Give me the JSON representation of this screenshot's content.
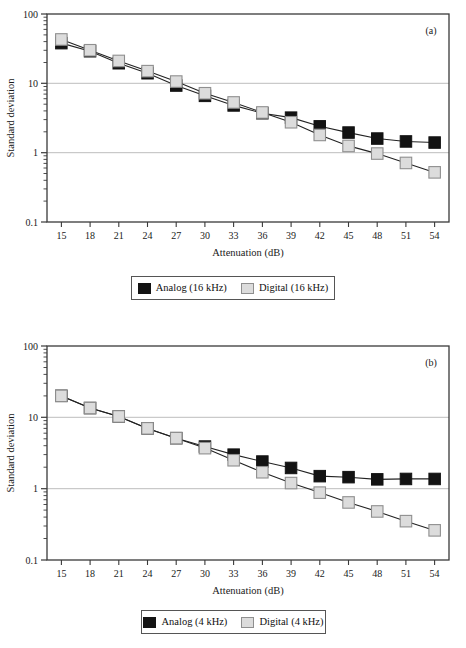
{
  "figure": {
    "panels": [
      {
        "key": "a",
        "label": "(a)",
        "legend": {
          "analog_label": "Analog (16 kHz)",
          "digital_label": "Digital (16 kHz)"
        }
      },
      {
        "key": "b",
        "label": "(b)",
        "legend": {
          "analog_label": "Analog (4 kHz)",
          "digital_label": "Digital (4 kHz)"
        }
      }
    ],
    "colors": {
      "analog": "#131313",
      "digital": "#dcdcdc",
      "digital_border": "#8f8f8f",
      "axis": "#3a3a3a",
      "gridline": "#bdbdbd",
      "line": "#222222"
    }
  },
  "chart_data": [
    {
      "type": "line",
      "panel": "a",
      "title": "",
      "xlabel": "Attenuation (dB)",
      "ylabel": "Standard deviation",
      "yscale": "log",
      "ylim": [
        0.1,
        100
      ],
      "ytick_labels": [
        "100",
        "10",
        "1",
        "0.1"
      ],
      "ytick_values": [
        100,
        10,
        1,
        0.1
      ],
      "grid": true,
      "grid_axis": "y",
      "legend_position": "below",
      "annotation": "(a)",
      "categories": [
        15,
        18,
        21,
        24,
        27,
        30,
        33,
        36,
        39,
        42,
        45,
        48,
        51,
        54
      ],
      "xtick_labels": [
        "15",
        "18",
        "21",
        "24",
        "27",
        "30",
        "33",
        "36",
        "39",
        "42",
        "45",
        "48",
        "51",
        "54"
      ],
      "series": [
        {
          "name": "Analog (16 kHz)",
          "marker": "square",
          "color": "#131313",
          "values": [
            38,
            29,
            19.5,
            14,
            9.3,
            6.6,
            4.8,
            3.7,
            3.2,
            2.4,
            1.95,
            1.6,
            1.45,
            1.4
          ]
        },
        {
          "name": "Digital (16 kHz)",
          "marker": "square",
          "color": "#dcdcdc",
          "values": [
            43,
            30,
            21,
            15,
            10.6,
            7.2,
            5.3,
            3.8,
            2.75,
            1.8,
            1.25,
            0.97,
            0.71,
            0.52
          ]
        }
      ]
    },
    {
      "type": "line",
      "panel": "b",
      "title": "",
      "xlabel": "Attenuation (dB)",
      "ylabel": "Standard deviation",
      "yscale": "log",
      "ylim": [
        0.1,
        100
      ],
      "ytick_labels": [
        "100",
        "10",
        "1",
        "0.1"
      ],
      "ytick_values": [
        100,
        10,
        1,
        0.1
      ],
      "grid": true,
      "grid_axis": "y",
      "legend_position": "below",
      "annotation": "(b)",
      "categories": [
        15,
        18,
        21,
        24,
        27,
        30,
        33,
        36,
        39,
        42,
        45,
        48,
        51,
        54
      ],
      "xtick_labels": [
        "15",
        "18",
        "21",
        "24",
        "27",
        "30",
        "33",
        "36",
        "39",
        "42",
        "45",
        "48",
        "51",
        "54"
      ],
      "series": [
        {
          "name": "Analog (4 kHz)",
          "marker": "square",
          "color": "#131313",
          "values": [
            20,
            13.5,
            10.3,
            7.0,
            5.1,
            3.9,
            3.0,
            2.4,
            1.95,
            1.5,
            1.45,
            1.35,
            1.37,
            1.37
          ]
        },
        {
          "name": "Digital (4 kHz)",
          "marker": "square",
          "color": "#dcdcdc",
          "values": [
            20,
            13.5,
            10.3,
            7.0,
            5.1,
            3.7,
            2.5,
            1.7,
            1.2,
            0.88,
            0.64,
            0.48,
            0.35,
            0.26
          ]
        }
      ]
    }
  ]
}
